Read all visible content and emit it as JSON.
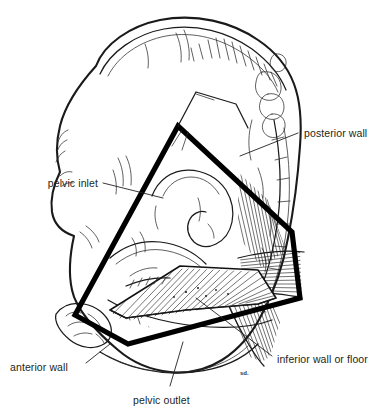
{
  "figure": {
    "kind": "anatomical-line-drawing",
    "background_color": "#ffffff",
    "ink_color": "#1a1a1a",
    "text_color": "#231f20"
  },
  "labels": {
    "posterior_wall": "posterior  wall",
    "pelvic_inlet": "pelvic inlet",
    "anterior_wall": "anterior wall",
    "pelvic_outlet": "pelvic outlet",
    "inferior_wall": "inferior wall or floor"
  },
  "annotation_marks": {
    "artist_signature": "sd."
  }
}
